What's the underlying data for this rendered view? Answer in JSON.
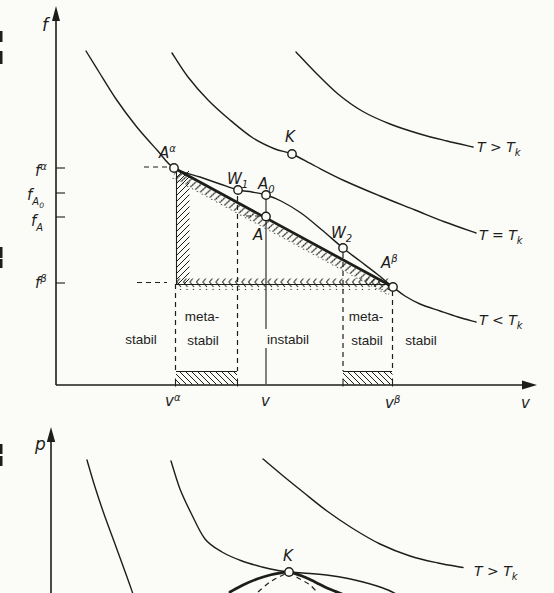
{
  "figure_title": "Free energy and pressure isotherms with double-tangent (common tangent) construction",
  "colors": {
    "ink": "#1d1d1b",
    "paper": "#fbfbf8"
  },
  "labels": {
    "f_axis": "f",
    "v_axis": "v",
    "p_axis": "p",
    "f_alpha": {
      "base": "f",
      "sup": "α"
    },
    "f_A0": {
      "base": "f",
      "sub": "A",
      "subsub": "0"
    },
    "f_A": {
      "base": "f",
      "sub": "A"
    },
    "f_beta": {
      "base": "f",
      "sup": "β"
    },
    "v_alpha": {
      "base": "v",
      "sup": "α"
    },
    "v_point": "v",
    "v_beta": {
      "base": "v",
      "sup": "β"
    },
    "A_alpha": {
      "base": "A",
      "sup": "α"
    },
    "A0": {
      "base": "A",
      "sub": "0"
    },
    "A": "A",
    "W1": {
      "base": "W",
      "sub": "1"
    },
    "W2": {
      "base": "W",
      "sub": "2"
    },
    "A_beta": {
      "base": "A",
      "sup": "β"
    },
    "K": "K",
    "K_bottom": "K",
    "T_gt": {
      "text": "T > T",
      "sub": "k"
    },
    "T_eq": {
      "text": "T = T",
      "sub": "k"
    },
    "T_lt": {
      "text": "T < T",
      "sub": "k"
    },
    "T_gt_bottom": {
      "text": "T > T",
      "sub": "k"
    }
  },
  "regions": {
    "stabil_left": "stabil",
    "meta_left_1": "meta-",
    "meta_left_2": "stabil",
    "instabil": "instabil",
    "meta_right_1": "meta-",
    "meta_right_2": "stabil",
    "stabil_right": "stabil"
  },
  "chart_data": [
    {
      "id": "free-energy-vs-volume",
      "type": "line",
      "title": "",
      "xlabel": "v",
      "ylabel": "f",
      "axes_numeric": false,
      "grid": false,
      "note": "Qualitative sketch; point coordinates are figure pixel positions (y grows downward).",
      "series": [
        {
          "name": "isotherm T < Tk",
          "style": "solid",
          "points": [
            [
              86,
              51
            ],
            [
              99,
              72
            ],
            [
              116,
              99
            ],
            [
              136,
              126
            ],
            [
              157,
              150
            ],
            [
              174,
              168
            ],
            [
              200,
              177
            ],
            [
              220,
              184
            ],
            [
              238,
              190
            ],
            [
              252,
              192
            ],
            [
              266,
              195
            ],
            [
              281,
              201
            ],
            [
              301,
              213
            ],
            [
              322,
              230
            ],
            [
              343,
              248
            ],
            [
              360,
              261
            ],
            [
              377,
              274
            ],
            [
              393,
              287
            ],
            [
              405,
              296
            ],
            [
              420,
              304
            ],
            [
              440,
              311
            ],
            [
              458,
              317
            ],
            [
              476,
              322
            ]
          ]
        },
        {
          "name": "isotherm T = Tk",
          "style": "solid",
          "points": [
            [
              172,
              53
            ],
            [
              188,
              77
            ],
            [
              208,
              100
            ],
            [
              230,
              120
            ],
            [
              253,
              138
            ],
            [
              275,
              149
            ],
            [
              292,
              154
            ],
            [
              315,
              166
            ],
            [
              345,
              181
            ],
            [
              380,
              196
            ],
            [
              415,
              210
            ],
            [
              445,
              222
            ],
            [
              476,
              233
            ]
          ]
        },
        {
          "name": "isotherm T > Tk",
          "style": "solid",
          "points": [
            [
              296,
              52
            ],
            [
              315,
              72
            ],
            [
              338,
              94
            ],
            [
              362,
              111
            ],
            [
              390,
              124
            ],
            [
              420,
              134
            ],
            [
              447,
              141
            ],
            [
              473,
              147
            ]
          ]
        },
        {
          "name": "double tangent Aα-Aβ",
          "style": "thick",
          "points": [
            [
              174,
              168
            ],
            [
              393,
              287
            ]
          ]
        }
      ],
      "markers": {
        "A_alpha": [
          174,
          168
        ],
        "W1": [
          238,
          190
        ],
        "A0": [
          266,
          195
        ],
        "A": [
          266,
          216.5
        ],
        "W2": [
          343,
          248
        ],
        "A_beta": [
          393,
          287
        ],
        "K": [
          292,
          154
        ]
      },
      "curve_labels": [
        "T > Tk",
        "T = Tk",
        "T < Tk"
      ],
      "y_ticks": [
        "f α",
        "f A0",
        "f A",
        "f β"
      ],
      "x_ticks": [
        "v α",
        "v",
        "v β"
      ],
      "x_tick_positions": [
        175.5,
        266,
        392.5
      ],
      "regions": [
        "stabil",
        "meta-stabil",
        "instabil",
        "meta-stabil",
        "stabil"
      ],
      "region_boundaries_x": [
        175.5,
        237.5,
        343,
        392.5
      ]
    },
    {
      "id": "pressure-vs-volume",
      "type": "line",
      "title": "",
      "xlabel": "",
      "ylabel": "p",
      "axes_numeric": false,
      "grid": false,
      "note": "Lower diagram is cropped at the image bottom edge.",
      "series": [
        {
          "name": "isotherm T < Tk (left branch)",
          "style": "solid",
          "points": [
            [
              87,
              460
            ],
            [
              95,
              487
            ],
            [
              104,
              514
            ],
            [
              115,
              544
            ],
            [
              127,
              577
            ],
            [
              133,
              594
            ]
          ]
        },
        {
          "name": "isotherm T = Tk",
          "style": "solid",
          "points": [
            [
              171,
              461
            ],
            [
              180,
              489
            ],
            [
              191,
              513
            ],
            [
              205,
              539
            ],
            [
              222,
              552
            ],
            [
              242,
              561
            ],
            [
              262,
              567
            ],
            [
              278,
              570.5
            ],
            [
              289,
              572
            ],
            [
              310,
              573.5
            ],
            [
              330,
              575.5
            ],
            [
              348,
              578.5
            ],
            [
              363,
              582
            ],
            [
              377,
              586
            ],
            [
              388,
              590
            ],
            [
              396,
              594
            ]
          ]
        },
        {
          "name": "isotherm T > Tk",
          "style": "solid",
          "points": [
            [
              263,
              459
            ],
            [
              282,
              475
            ],
            [
              303,
              492
            ],
            [
              327,
              511
            ],
            [
              352,
              528
            ],
            [
              380,
              544
            ],
            [
              410,
              556
            ],
            [
              438,
              563
            ],
            [
              463,
              567.5
            ]
          ]
        },
        {
          "name": "coexistence curve (binodal, thick)",
          "style": "thick",
          "points": [
            [
              230,
              592
            ],
            [
              243,
              585
            ],
            [
              257,
              579
            ],
            [
              270,
              575
            ],
            [
              281,
              572.8
            ],
            [
              289,
              572
            ],
            [
              302,
              576
            ],
            [
              315,
              582
            ],
            [
              327,
              588
            ],
            [
              337,
              592
            ],
            [
              342,
              594
            ]
          ]
        },
        {
          "name": "spinodal (dashed)",
          "style": "dashed",
          "points": [
            [
              258,
              592
            ],
            [
              270,
              582
            ],
            [
              282,
              575.5
            ],
            [
              289,
              573.5
            ],
            [
              300,
              579
            ],
            [
              310,
              585
            ],
            [
              317,
              592
            ]
          ]
        }
      ],
      "markers": {
        "K": [
          289,
          572
        ]
      },
      "curve_labels": [
        "T > Tk"
      ]
    }
  ]
}
